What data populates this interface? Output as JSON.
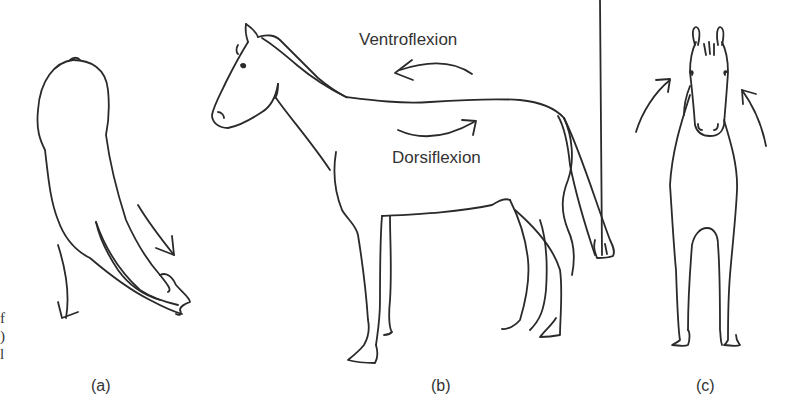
{
  "figure": {
    "panels": [
      {
        "id": "a",
        "label": "(a)",
        "view": "top view of head and neck, lateral flexion"
      },
      {
        "id": "b",
        "label": "(b)",
        "view": "side view"
      },
      {
        "id": "c",
        "label": "(c)",
        "view": "front view"
      }
    ],
    "annotations": {
      "ventroflexion": "Ventroflexion",
      "dorsiflexion": "Dorsiflexion"
    },
    "cropped_caption_fragments": [
      "f",
      ")",
      "l"
    ],
    "colors": {
      "line": "#2a2a2a",
      "background": "#ffffff"
    }
  }
}
